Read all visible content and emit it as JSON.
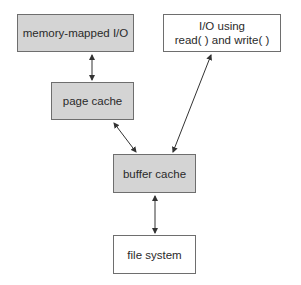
{
  "diagram": {
    "nodes": [
      {
        "id": "mmio",
        "label": "memory-mapped I/O",
        "shaded": true
      },
      {
        "id": "rw",
        "label_line1": "I/O using",
        "label_line2": "read( ) and write( )",
        "shaded": false
      },
      {
        "id": "page_cache",
        "label": "page cache",
        "shaded": true
      },
      {
        "id": "buffer_cache",
        "label": "buffer cache",
        "shaded": true
      },
      {
        "id": "fs",
        "label": "file system",
        "shaded": false
      }
    ],
    "edges": [
      {
        "from": "mmio",
        "to": "page_cache",
        "bidirectional": true
      },
      {
        "from": "page_cache",
        "to": "buffer_cache",
        "bidirectional": true
      },
      {
        "from": "buffer_cache",
        "to": "rw",
        "bidirectional": true
      },
      {
        "from": "buffer_cache",
        "to": "fs",
        "bidirectional": true
      }
    ],
    "colors": {
      "shaded_fill": "#d4d4d4",
      "border": "#6e6e6e",
      "arrow": "#333333"
    }
  }
}
